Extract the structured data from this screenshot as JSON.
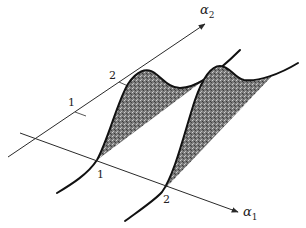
{
  "figure": {
    "axes": {
      "alpha1": {
        "symbol": "α",
        "subscript": "1",
        "ticks": [
          "1",
          "2"
        ]
      },
      "alpha2": {
        "symbol": "α",
        "subscript": "2",
        "ticks": [
          "1",
          "2"
        ]
      }
    },
    "curves": [
      {
        "name": "distribution at alpha1 = 1",
        "position_label": "1"
      },
      {
        "name": "distribution at alpha1 = 2",
        "position_label": "2"
      }
    ],
    "colors": {
      "line": "#2a2a2a",
      "curve": "#111111",
      "shade": "#6e6e6e",
      "background": "#ffffff"
    }
  }
}
